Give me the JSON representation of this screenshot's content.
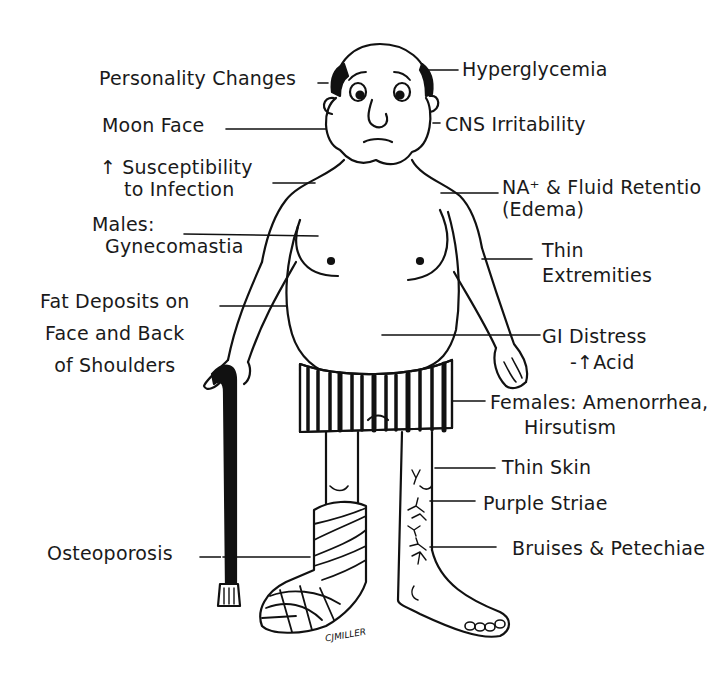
{
  "labels": {
    "personality": "Personality Changes",
    "moon_face": "Moon Face",
    "infection_1": "↑ Susceptibility",
    "infection_2": "to Infection",
    "males_1": "Males:",
    "males_2": "Gynecomastia",
    "fat_1": "Fat Deposits on",
    "fat_2": "Face and Back",
    "fat_3": "of Shoulders",
    "osteoporosis": "Osteoporosis",
    "hyperglycemia": "Hyperglycemia",
    "cns": "CNS Irritability",
    "na_1": "NA⁺ & Fluid Retentio",
    "na_2": "(Edema)",
    "thin_ext_1": "Thin",
    "thin_ext_2": "Extremities",
    "gi_1": "GI Distress",
    "gi_2": "-↑Acid",
    "females_1": "Females: Amenorrhea,",
    "females_2": "Hirsutism",
    "thin_skin": "Thin Skin",
    "purple_striae": "Purple Striae",
    "bruises": "Bruises & Petechiae"
  },
  "signature": "CJMILLER",
  "colors": {
    "ink": "#111111",
    "background": "#ffffff"
  }
}
